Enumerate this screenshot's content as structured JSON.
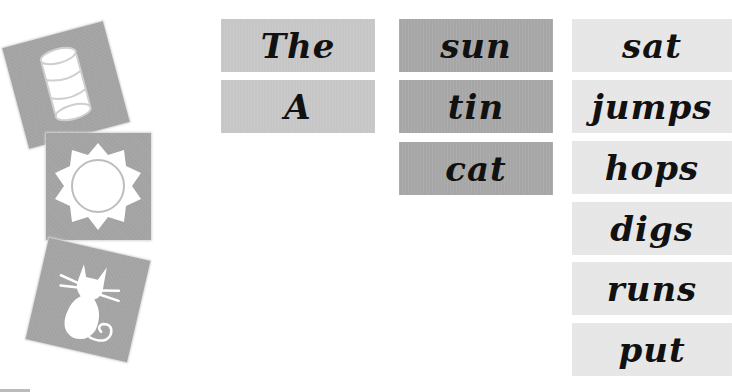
{
  "picture_tiles": [
    {
      "name": "tin",
      "icon": "tin-can-icon"
    },
    {
      "name": "sun",
      "icon": "sun-icon"
    },
    {
      "name": "cat",
      "icon": "cat-icon"
    }
  ],
  "columns": {
    "determiners": [
      "The",
      "A"
    ],
    "nouns": [
      "sun",
      "tin",
      "cat"
    ],
    "verbs": [
      "sat",
      "jumps",
      "hops",
      "digs",
      "runs",
      "put"
    ]
  },
  "colors": {
    "tile": "#a3a3a3",
    "determiner_card": "#c6c6c6",
    "noun_card": "#a6a6a6",
    "verb_card": "#e6e6e6",
    "text": "#111111"
  }
}
